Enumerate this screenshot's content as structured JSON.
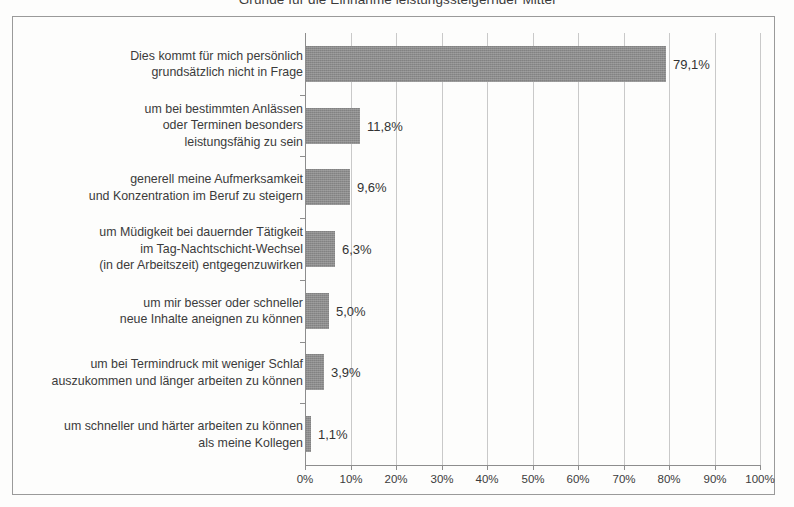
{
  "figure": {
    "title_clipped": "Gründe für die Einnahme leistungssteigernder Mittel",
    "frame_border_color": "#9a9a9a",
    "background_color": "#fdfdfc"
  },
  "chart_data": {
    "type": "bar",
    "orientation": "horizontal",
    "title": "",
    "xlabel": "",
    "ylabel": "",
    "xlim": [
      0,
      100
    ],
    "xtick_labels": [
      "0%",
      "10%",
      "20%",
      "30%",
      "40%",
      "50%",
      "60%",
      "70%",
      "80%",
      "90%",
      "100%"
    ],
    "xtick_values": [
      0,
      10,
      20,
      30,
      40,
      50,
      60,
      70,
      80,
      90,
      100
    ],
    "grid": true,
    "legend": false,
    "bar_color": "#8c8c8c",
    "categories": [
      "Dies kommt für mich persönlich\ngrundsätzlich nicht in Frage",
      "um bei bestimmten Anlässen\noder Terminen besonders\nleistungsfähig zu sein",
      "generell meine Aufmerksamkeit\nund Konzentration im Beruf zu steigern",
      "um Müdigkeit bei dauernder Tätigkeit\nim Tag-Nachtschicht-Wechsel\n(in der Arbeitszeit) entgegenzuwirken",
      "um mir besser oder schneller\nneue Inhalte aneignen zu können",
      "um bei Termindruck mit weniger Schlaf\nauszukommen und länger arbeiten zu können",
      "um schneller und härter arbeiten zu können\nals meine Kollegen"
    ],
    "values": [
      79.1,
      11.8,
      9.6,
      6.3,
      5.0,
      3.9,
      1.1
    ],
    "value_labels": [
      "79,1%",
      "11,8%",
      "9,6%",
      "6,3%",
      "5,0%",
      "3,9%",
      "1,1%"
    ]
  }
}
